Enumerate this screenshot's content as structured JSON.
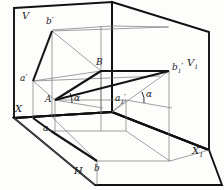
{
  "figure": {
    "type": "descriptive-geometry-projection",
    "background": "#fdfdfc",
    "ink": "#1b1b1b",
    "thin_line_color": "#6f6f6f",
    "plane_edge_color": "#111111"
  },
  "labels": {
    "plane_v": "V",
    "plane_v1": "V",
    "plane_v1_sub": "1",
    "plane_h": "H",
    "axis_x": "X",
    "axis_x1": "X",
    "axis_x1_sub": "1",
    "point_b_front": "b",
    "point_b_front_prime": "′",
    "point_a_front": "a",
    "point_a_front_prime": "′",
    "point_B": "B",
    "point_A": "A",
    "point_b1_front": "b",
    "point_b1_front_sub": "1",
    "point_b1_front_prime": "′",
    "point_a1_front": "a",
    "point_a1_front_sub": "1",
    "point_a1_front_prime": "′",
    "point_a_plan": "a",
    "point_b_plan": "b",
    "angle_left": "α",
    "angle_right": "α"
  },
  "geometry": {
    "points": {
      "b_front": [
        52,
        31
      ],
      "a_front": [
        33,
        81
      ],
      "B": [
        101,
        71
      ],
      "A": [
        55,
        100
      ],
      "b1_front": [
        169,
        71
      ],
      "a1_front": [
        126,
        100
      ],
      "a_plan": [
        51,
        131
      ],
      "b_plan": [
        97,
        161
      ]
    },
    "angles": {
      "alpha_left_deg": 20,
      "alpha_right_deg": 22
    }
  }
}
